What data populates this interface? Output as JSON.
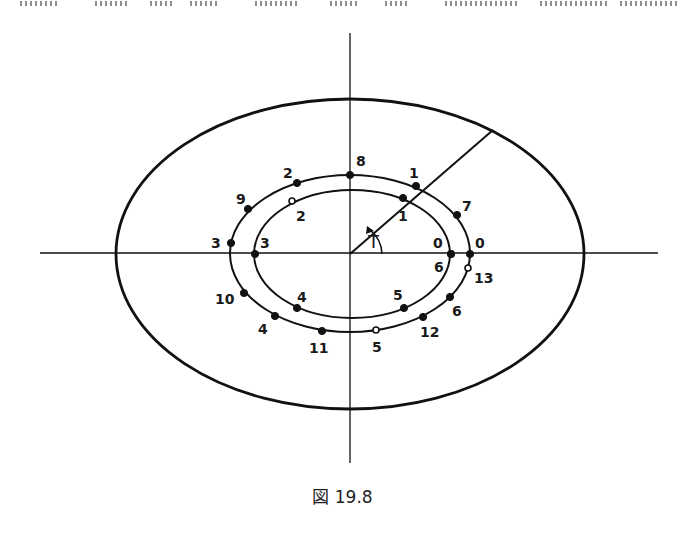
{
  "header_fragment": {
    "note": "cropped text line at top edge (illegible)",
    "segments_x": [
      [
        20,
        60
      ],
      [
        95,
        130
      ],
      [
        150,
        175
      ],
      [
        190,
        220
      ],
      [
        255,
        300
      ],
      [
        330,
        360
      ],
      [
        385,
        410
      ],
      [
        445,
        520
      ],
      [
        540,
        610
      ],
      [
        620,
        680
      ]
    ]
  },
  "caption": {
    "label": "図 19.8"
  },
  "figure": {
    "axes": {
      "horizontal": {
        "x1": 40,
        "y": 253,
        "x2": 658
      },
      "vertical": {
        "x": 350,
        "y1": 33,
        "y2": 463
      }
    },
    "outer_ellipse": {
      "cx": 350,
      "cy": 254,
      "rx": 234,
      "ry": 155
    },
    "middle_ellipse": {
      "cx": 350,
      "cy": 253.5,
      "rx": 120,
      "ry": 78.5
    },
    "inner_ellipse": {
      "cx": 352,
      "cy": 254,
      "rx": 98,
      "ry": 64
    },
    "radius_line": {
      "x1": 350,
      "y1": 254,
      "x2": 493,
      "y2": 130
    },
    "angle_label": {
      "text": "T",
      "x": 368,
      "y": 248
    },
    "middle_points": [
      {
        "label": "8",
        "x": 350,
        "y": 175,
        "lx": 356,
        "ly": 166,
        "hollow": false
      },
      {
        "label": "1",
        "x": 416,
        "y": 186,
        "lx": 409,
        "ly": 178,
        "hollow": false
      },
      {
        "label": "7",
        "x": 457,
        "y": 215,
        "lx": 462,
        "ly": 211,
        "hollow": false
      },
      {
        "label": "0",
        "x": 470,
        "y": 254,
        "lx": 475,
        "ly": 248,
        "hollow": false
      },
      {
        "label": "13",
        "x": 468,
        "y": 268,
        "lx": 474,
        "ly": 283,
        "hollow": true
      },
      {
        "label": "6",
        "x": 450,
        "y": 297,
        "lx": 452,
        "ly": 316,
        "hollow": false
      },
      {
        "label": "12",
        "x": 423,
        "y": 317,
        "lx": 420,
        "ly": 337,
        "hollow": false
      },
      {
        "label": "5",
        "x": 376,
        "y": 330,
        "lx": 372,
        "ly": 352,
        "hollow": true
      },
      {
        "label": "11",
        "x": 322,
        "y": 331,
        "lx": 309,
        "ly": 353,
        "hollow": false
      },
      {
        "label": "4",
        "x": 275,
        "y": 316,
        "lx": 258,
        "ly": 334,
        "hollow": false
      },
      {
        "label": "10",
        "x": 244,
        "y": 293,
        "lx": 215,
        "ly": 304,
        "hollow": false
      },
      {
        "label": "3",
        "x": 231,
        "y": 243,
        "lx": 211,
        "ly": 248,
        "hollow": false
      },
      {
        "label": "9",
        "x": 248,
        "y": 209,
        "lx": 236,
        "ly": 204,
        "hollow": false
      },
      {
        "label": "2",
        "x": 297,
        "y": 183,
        "lx": 283,
        "ly": 178,
        "hollow": false
      }
    ],
    "inner_points": [
      {
        "label": "1",
        "x": 403,
        "y": 198,
        "lx": 398,
        "ly": 221,
        "hollow": false
      },
      {
        "label": "0",
        "x": 451,
        "y": 254,
        "lx": 433,
        "ly": 248,
        "hollow": false
      },
      {
        "label": "6",
        "x": 451,
        "y": 254,
        "lx": 434,
        "ly": 272,
        "hollow": false
      },
      {
        "label": "5",
        "x": 404,
        "y": 308,
        "lx": 393,
        "ly": 300,
        "hollow": false
      },
      {
        "label": "4",
        "x": 297,
        "y": 308,
        "lx": 297,
        "ly": 302,
        "hollow": false
      },
      {
        "label": "3",
        "x": 255,
        "y": 254,
        "lx": 260,
        "ly": 248,
        "hollow": false
      },
      {
        "label": "2",
        "x": 292,
        "y": 201,
        "lx": 296,
        "ly": 221,
        "hollow": true
      }
    ]
  }
}
